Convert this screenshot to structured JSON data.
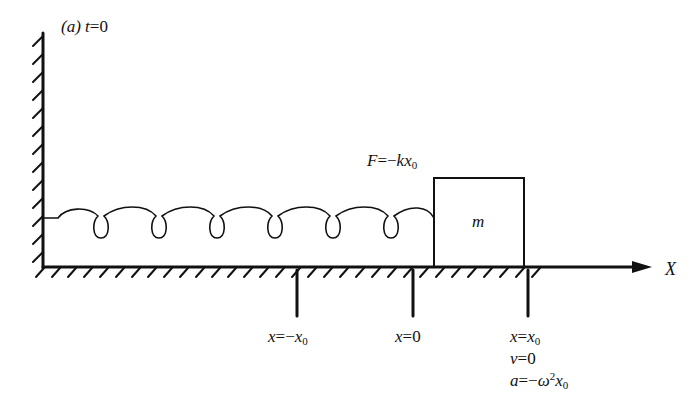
{
  "figure": {
    "panel_label": "(a)",
    "time_label": {
      "var": "t",
      "eq": "=0"
    },
    "force_label": {
      "var": "F",
      "eq": "=−",
      "k": "k",
      "x": "x",
      "sub": "0"
    },
    "mass_label": "m",
    "axis_label": "X",
    "markers": [
      {
        "id": "neg-x0",
        "var": "x",
        "eq": "=−",
        "x": "x",
        "sub": "0"
      },
      {
        "id": "zero",
        "var": "x",
        "eq": "=0"
      },
      {
        "id": "pos-x0",
        "var": "x",
        "eq": "=",
        "x": "x",
        "sub": "0"
      }
    ],
    "state_at_x0": {
      "velocity": {
        "var": "v",
        "eq": "=0"
      },
      "acceleration": {
        "var": "a",
        "eq": "=−",
        "omega": "ω",
        "sup": "2",
        "x": "x",
        "sub": "0"
      }
    },
    "colors": {
      "ink": "#111111",
      "background": "#ffffff"
    }
  }
}
